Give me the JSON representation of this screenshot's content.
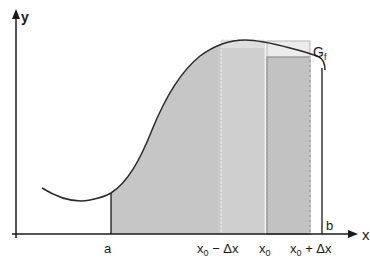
{
  "diagram": {
    "type": "integral-derivation-figure",
    "axes": {
      "x_label": "x",
      "y_label": "y"
    },
    "curve": {
      "label_main": "G",
      "label_sub": "f"
    },
    "x_ticks": {
      "a": "a",
      "x0_minus_dx": {
        "base": "x",
        "sub": "0",
        "suffix": " − Δx"
      },
      "x0": {
        "base": "x",
        "sub": "0",
        "suffix": ""
      },
      "x0_plus_dx": {
        "base": "x",
        "sub": "0",
        "suffix": " + Δx"
      },
      "b": "b"
    },
    "colors": {
      "axis": "#1a1a1a",
      "curve": "#2a2a2a",
      "area_fill": "#c6c6c6",
      "strip_fill": "#cfcfcf",
      "strip_top_light": "#e6e6e6",
      "strip_right_fill": "#c2c2c2",
      "strip_border": "#9a9a9a"
    }
  }
}
